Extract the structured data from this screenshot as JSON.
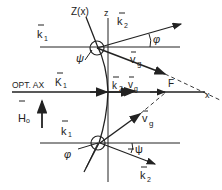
{
  "diagram": {
    "labels": {
      "curve": "Z(x)",
      "z_axis": "z",
      "x_axis": "x",
      "optical_axis": "OPT. AX",
      "focus": "F",
      "k1_top": "k",
      "k1_top_sub": "1",
      "k1_axis": "K",
      "k1_axis_sub": "1",
      "k1_bottom": "k",
      "k1_bottom_sub": "1",
      "k2_top": "k",
      "k2_top_sub": "2",
      "k2_axis": "k",
      "k2_axis_sub": "2",
      "k2_bottom": "k",
      "k2_bottom_sub": "2",
      "vg_top": "v",
      "vg_top_sub": "g",
      "vg_axis": "v",
      "vg_axis_sub": "g",
      "vg_bottom": "v",
      "vg_bottom_sub": "g",
      "phi_top": "φ",
      "psi_top": "ψ",
      "phi_bottom": "φ",
      "psi_bottom": "ψ",
      "h0": "H",
      "h0_sub": "o"
    },
    "colors": {
      "ink": "#222222",
      "background": "#ffffff"
    }
  }
}
